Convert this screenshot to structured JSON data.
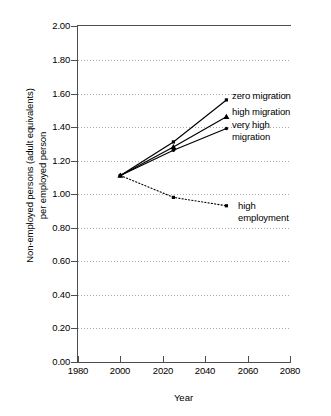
{
  "chart_data": {
    "type": "line",
    "title": "",
    "xlabel": "Year",
    "ylabel": "Non-employed persons (adult equivalents)\nper employed person",
    "xlim": [
      1980,
      2080
    ],
    "ylim": [
      0.0,
      2.0
    ],
    "xticks": [
      "1980",
      "2000",
      "2020",
      "2040",
      "2060",
      "2080"
    ],
    "yticks": [
      "0.00",
      "0.20",
      "0.40",
      "0.60",
      "0.80",
      "1.00",
      "1.20",
      "1.40",
      "1.60",
      "1.80",
      "2.00"
    ],
    "grid": "horizontal-dotted",
    "legend_position": "inline-right-of-endpoints",
    "x": [
      2000,
      2025,
      2050
    ],
    "series": [
      {
        "name": "zero migration",
        "marker": "square",
        "linestyle": "solid",
        "color": "#000000",
        "values": [
          1.11,
          1.31,
          1.56
        ]
      },
      {
        "name": "high migration",
        "marker": "triangle",
        "linestyle": "solid",
        "color": "#000000",
        "values": [
          1.11,
          1.28,
          1.46
        ]
      },
      {
        "name": "very high migration",
        "marker": "circle",
        "linestyle": "solid",
        "color": "#000000",
        "values": [
          1.11,
          1.26,
          1.39
        ]
      },
      {
        "name": "high employment",
        "marker": "square",
        "linestyle": "dotted",
        "color": "#000000",
        "values": [
          1.11,
          0.98,
          0.93
        ]
      }
    ]
  },
  "legend": {
    "zero_migration": "zero migration",
    "high_migration": "high migration",
    "very_high_migration": "very high\nmigration",
    "high_employment": "high\nemployment"
  },
  "axes": {
    "x_title": "Year",
    "y_title": "Non-employed persons (adult equivalents)\nper employed person"
  }
}
